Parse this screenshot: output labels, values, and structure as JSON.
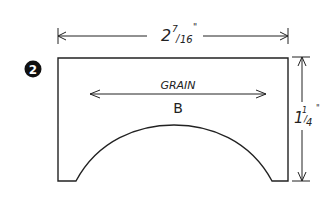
{
  "figure": {
    "step_number": "2",
    "part_label": "B",
    "grain_label": "GRAIN",
    "width_dimension": {
      "whole": "2",
      "numerator": "7",
      "denominator": "16",
      "unit": "\""
    },
    "height_dimension": {
      "whole": "1",
      "numerator": "1",
      "denominator": "4",
      "unit": "\""
    },
    "colors": {
      "ink": "#222222",
      "background": "#ffffff"
    }
  }
}
